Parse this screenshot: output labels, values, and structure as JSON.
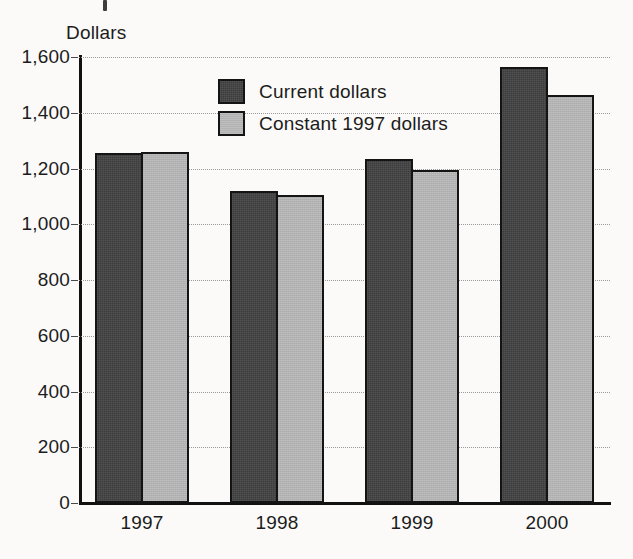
{
  "chart_data": {
    "type": "bar",
    "title": "",
    "xlabel": "",
    "ylabel": "Dollars",
    "categories": [
      "1997",
      "1998",
      "1999",
      "2000"
    ],
    "series": [
      {
        "name": "Current dollars",
        "values": [
          1255,
          1120,
          1235,
          1565
        ],
        "color": "#3c3c3c"
      },
      {
        "name": "Constant 1997 dollars",
        "values": [
          1260,
          1105,
          1195,
          1465
        ],
        "color": "#b2b2b2"
      }
    ],
    "ylim": [
      0,
      1600
    ],
    "ytick_values": [
      0,
      200,
      400,
      600,
      800,
      1000,
      1200,
      1400,
      1600
    ],
    "ytick_labels": [
      "0",
      "200",
      "400",
      "600",
      "800",
      "1,000",
      "1,200",
      "1,400",
      "1,600"
    ],
    "grid": true,
    "grid_axis": "y",
    "grid_style": "dotted",
    "legend_position": "upper-center",
    "bar_outline_color": "#141414",
    "background_color": "#fbfaf8"
  },
  "axis": {
    "y_title": "Dollars"
  },
  "legend": {
    "entries": [
      {
        "label": "Current dollars"
      },
      {
        "label": "Constant 1997 dollars"
      }
    ]
  }
}
